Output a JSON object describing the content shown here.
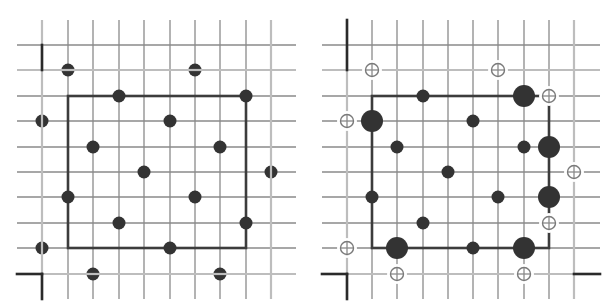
{
  "figure": {
    "width": 611,
    "height": 307,
    "colors": {
      "grid": "#8a8a8a",
      "grid_light": "#bdbdbd",
      "frame_dark": "#2a2a2a",
      "box": "#3c3c3c",
      "dot": "#333333",
      "open_ring": "#7a7a7a",
      "background": "#ffffff"
    },
    "grid": {
      "count": 10,
      "rows_y": [
        45,
        70,
        96,
        121,
        147,
        172,
        197,
        223,
        248,
        274
      ],
      "line_top": 20,
      "line_bottom": 299,
      "light_cols": [
        0,
        9
      ],
      "light_rows": [
        1,
        9
      ]
    }
  },
  "panels": [
    {
      "name": "left-panel",
      "cols_x": [
        42,
        68,
        93,
        119,
        144,
        170,
        195,
        220,
        246,
        271
      ],
      "line_left": 17,
      "line_right": 296,
      "box": {
        "col_from": 1,
        "col_to": 8,
        "row_from": 2,
        "row_to": 8
      },
      "corner_marks": [
        {
          "x1": 42,
          "y1": 45,
          "x2": 42,
          "y2": 70
        },
        {
          "x1": 17,
          "y1": 274,
          "x2": 42,
          "y2": 274
        },
        {
          "x1": 42,
          "y1": 274,
          "x2": 42,
          "y2": 299
        }
      ],
      "split_dots": [
        {
          "col": 1,
          "row": 1,
          "orient": "h"
        },
        {
          "col": 6,
          "row": 1,
          "orient": "h"
        },
        {
          "col": 0,
          "row": 3,
          "orient": "v"
        },
        {
          "col": 9,
          "row": 5,
          "orient": "v"
        },
        {
          "col": 0,
          "row": 8,
          "orient": "v"
        },
        {
          "col": 2,
          "row": 9,
          "orient": "h"
        },
        {
          "col": 7,
          "row": 9,
          "orient": "h"
        }
      ],
      "solid_dots": [
        {
          "col": 3,
          "row": 2
        },
        {
          "col": 8,
          "row": 2
        },
        {
          "col": 5,
          "row": 3
        },
        {
          "col": 2,
          "row": 4
        },
        {
          "col": 7,
          "row": 4
        },
        {
          "col": 4,
          "row": 5
        },
        {
          "col": 1,
          "row": 6
        },
        {
          "col": 6,
          "row": 6
        },
        {
          "col": 3,
          "row": 7
        },
        {
          "col": 8,
          "row": 7
        },
        {
          "col": 5,
          "row": 8
        }
      ],
      "large_dots": [],
      "open_dots": []
    },
    {
      "name": "right-panel",
      "cols_x": [
        347,
        372,
        397,
        423,
        448,
        473,
        498,
        524,
        549,
        574
      ],
      "line_left": 322,
      "line_right": 600,
      "box": {
        "col_from": 1,
        "col_to": 8,
        "row_from": 2,
        "row_to": 8
      },
      "corner_marks": [
        {
          "x1": 347,
          "y1": 20,
          "x2": 347,
          "y2": 70
        },
        {
          "x1": 322,
          "y1": 274,
          "x2": 347,
          "y2": 274
        },
        {
          "x1": 347,
          "y1": 274,
          "x2": 347,
          "y2": 299
        },
        {
          "x1": 574,
          "y1": 274,
          "x2": 600,
          "y2": 274
        }
      ],
      "split_dots": [],
      "solid_dots": [
        {
          "col": 3,
          "row": 2
        },
        {
          "col": 5,
          "row": 3
        },
        {
          "col": 2,
          "row": 4
        },
        {
          "col": 7,
          "row": 4
        },
        {
          "col": 4,
          "row": 5
        },
        {
          "col": 1,
          "row": 6
        },
        {
          "col": 6,
          "row": 6
        },
        {
          "col": 3,
          "row": 7
        },
        {
          "col": 5,
          "row": 8
        }
      ],
      "large_dots": [
        {
          "col": 7,
          "row": 2
        },
        {
          "col": 1,
          "row": 3
        },
        {
          "col": 8,
          "row": 4
        },
        {
          "col": 8,
          "row": 6
        },
        {
          "col": 2,
          "row": 8
        },
        {
          "col": 7,
          "row": 8
        }
      ],
      "open_dots": [
        {
          "col": 1,
          "row": 1
        },
        {
          "col": 6,
          "row": 1
        },
        {
          "col": 8,
          "row": 2
        },
        {
          "col": 0,
          "row": 3
        },
        {
          "col": 9,
          "row": 5
        },
        {
          "col": 8,
          "row": 7
        },
        {
          "col": 0,
          "row": 8
        },
        {
          "col": 2,
          "row": 9
        },
        {
          "col": 7,
          "row": 9
        }
      ]
    }
  ]
}
